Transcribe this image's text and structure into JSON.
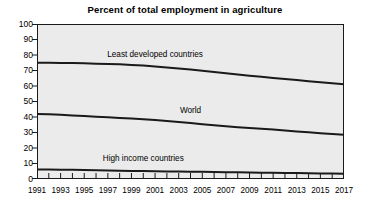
{
  "chart_data": {
    "type": "line",
    "title": "Percent of total employment in agriculture",
    "xlabel": "",
    "ylabel": "",
    "xlim": [
      1991,
      2017
    ],
    "ylim": [
      0,
      100
    ],
    "ytick_step": 10,
    "yticks": [
      100,
      90,
      80,
      70,
      60,
      50,
      40,
      30,
      20,
      10,
      0
    ],
    "xticks_labeled": [
      1991,
      1993,
      1995,
      1997,
      1999,
      2001,
      2003,
      2005,
      2007,
      2009,
      2011,
      2013,
      2015,
      2017
    ],
    "x": [
      1991,
      1992,
      1993,
      1994,
      1995,
      1996,
      1997,
      1998,
      1999,
      2000,
      2001,
      2002,
      2003,
      2004,
      2005,
      2006,
      2007,
      2008,
      2009,
      2010,
      2011,
      2012,
      2013,
      2014,
      2015,
      2016,
      2017
    ],
    "grid": false,
    "legend_position": "inline-annotations",
    "line_color": "#1a1a1a",
    "plot_background": "#ebebeb",
    "series": [
      {
        "name": "Least developed countries",
        "label_x": 2001,
        "label_y": 80,
        "values": [
          75.0,
          75.0,
          74.9,
          74.8,
          74.6,
          74.4,
          74.2,
          74.0,
          73.6,
          73.2,
          72.6,
          72.0,
          71.3,
          70.6,
          69.8,
          69.0,
          68.2,
          67.4,
          66.6,
          65.9,
          65.2,
          64.5,
          63.8,
          63.1,
          62.4,
          61.8,
          61.2
        ]
      },
      {
        "name": "World",
        "label_x": 2004,
        "label_y": 44,
        "values": [
          42.0,
          41.7,
          41.4,
          41.0,
          40.6,
          40.2,
          39.8,
          39.4,
          39.0,
          38.5,
          38.0,
          37.4,
          36.8,
          36.1,
          35.4,
          34.7,
          34.0,
          33.4,
          32.9,
          32.4,
          31.9,
          31.3,
          30.7,
          30.1,
          29.5,
          29.0,
          28.5
        ]
      },
      {
        "name": "High income countries",
        "label_x": 2000,
        "label_y": 13,
        "values": [
          6.2,
          6.1,
          6.0,
          5.9,
          5.8,
          5.6,
          5.5,
          5.4,
          5.2,
          5.1,
          5.0,
          4.9,
          4.8,
          4.7,
          4.6,
          4.5,
          4.4,
          4.3,
          4.2,
          4.1,
          4.0,
          3.9,
          3.8,
          3.7,
          3.6,
          3.5,
          3.4
        ]
      }
    ]
  }
}
